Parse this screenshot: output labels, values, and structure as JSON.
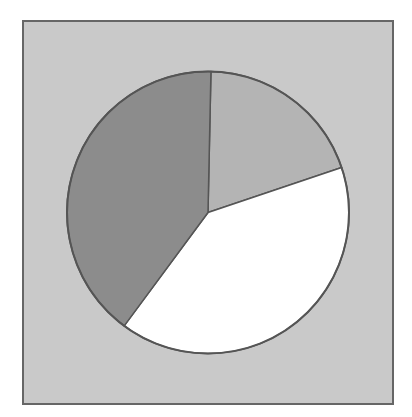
{
  "chart_data": {
    "type": "pie",
    "title": "",
    "labels": [
      "Slice A",
      "Slice B",
      "Slice C"
    ],
    "values": [
      19.5,
      40.3,
      40.2
    ],
    "colors": [
      "#b4b4b4",
      "#ffffff",
      "#8c8c8c"
    ],
    "start_angle_deg": 1.2,
    "direction": "clockwise",
    "legend": null,
    "background": "#c9c9c9",
    "frame_border_color": "#666666",
    "slice_border_color": "#555555"
  },
  "geometry": {
    "cx": 208,
    "cy": 212.5,
    "r": 141
  }
}
